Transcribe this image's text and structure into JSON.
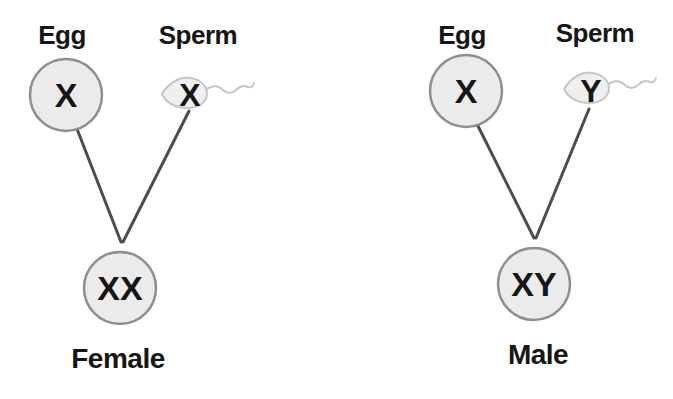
{
  "crosses": [
    {
      "egg_label": "Egg",
      "sperm_label": "Sperm",
      "egg_chromosome": "X",
      "sperm_chromosome": "X",
      "offspring_chromosomes": "XX",
      "offspring_sex": "Female"
    },
    {
      "egg_label": "Egg",
      "sperm_label": "Sperm",
      "egg_chromosome": "X",
      "sperm_chromosome": "Y",
      "offspring_chromosomes": "XY",
      "offspring_sex": "Male"
    }
  ],
  "colors": {
    "background": "#ffffff",
    "cell_fill": "#ebebeb",
    "cell_border": "#8e8e8e",
    "sperm_fill": "#efefef",
    "sperm_outline": "#c6c6c6",
    "line": "#4d4d4d",
    "text": "#161616"
  }
}
